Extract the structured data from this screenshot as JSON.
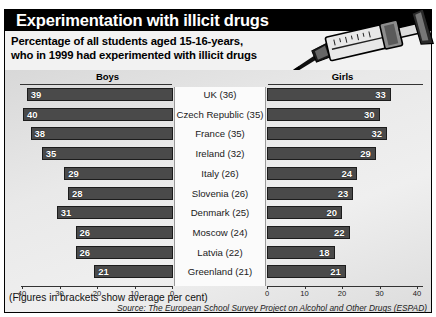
{
  "banner": {
    "title": "Experimentation with illicit drugs",
    "background_color": "#000000",
    "text_color": "#ffffff"
  },
  "subtitle": {
    "line1": "Percentage of all students aged 15-16-years,",
    "line2": "who in 1999 had experimented with illicit drugs"
  },
  "artwork": {
    "name": "syringe-illustration"
  },
  "footnote": "(Figures in brackets show average per cent)",
  "source": "Source: The European School Survey Project on Alcohol and Other Drugs (ESPAD)",
  "chart_data": {
    "type": "bar",
    "orientation": "horizontal",
    "layout": "butterfly",
    "title": "Experimentation with illicit drugs",
    "subtitle": "Percentage of all students aged 15-16-years, who in 1999 had experimented with illicit drugs",
    "xlabel": "",
    "ylabel": "",
    "grid": false,
    "legend_position": "top",
    "categories": [
      "UK (36)",
      "Czech Republic (35)",
      "France (35)",
      "Ireland (32)",
      "Italy (26)",
      "Slovenia (26)",
      "Denmark (25)",
      "Moscow (24)",
      "Latvia (22)",
      "Greenland (21)"
    ],
    "country_names": [
      "UK",
      "Czech Republic",
      "France",
      "Ireland",
      "Italy",
      "Slovenia",
      "Denmark",
      "Moscow",
      "Latvia",
      "Greenland"
    ],
    "averages": [
      36,
      35,
      35,
      32,
      26,
      26,
      25,
      24,
      22,
      21
    ],
    "series": [
      {
        "name": "Boys",
        "side": "left",
        "values": [
          39,
          40,
          38,
          35,
          29,
          28,
          31,
          26,
          26,
          21
        ]
      },
      {
        "name": "Girls",
        "side": "right",
        "values": [
          33,
          30,
          32,
          29,
          24,
          23,
          20,
          22,
          18,
          21
        ]
      }
    ],
    "xlim_left": [
      40,
      0
    ],
    "xlim_right": [
      0,
      40
    ],
    "ticks_left": [
      "40",
      "30",
      "20",
      "10",
      "0"
    ],
    "ticks_right": [
      "0",
      "10",
      "20",
      "30",
      "40"
    ],
    "tick_values": [
      0,
      10,
      20,
      30,
      40
    ],
    "bar_color": "#4a4a4a",
    "bar_border_color": "#1c1c1c",
    "value_label_color": "#ffffff"
  }
}
